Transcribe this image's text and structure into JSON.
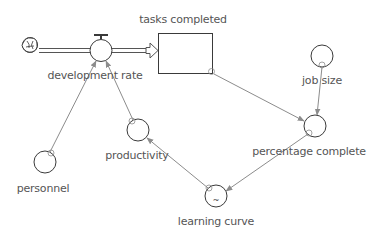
{
  "diagram": {
    "type": "stock-and-flow",
    "colors": {
      "shape_stroke": "#3a3a3a",
      "connector": "#8c8c8c",
      "label": "#555555",
      "background": "#ffffff"
    },
    "source": {
      "name": "cloud",
      "icon": "cloud-icon"
    },
    "flow": {
      "label": "development rate",
      "from": "cloud",
      "to": "tasks completed"
    },
    "stocks": [
      {
        "label": "tasks completed"
      }
    ],
    "converters": [
      {
        "id": "job_size",
        "label": "job size"
      },
      {
        "id": "percentage_complete",
        "label": "percentage complete"
      },
      {
        "id": "learning_curve",
        "label": "learning curve",
        "graphical_marker": "~"
      },
      {
        "id": "productivity",
        "label": "productivity"
      },
      {
        "id": "personnel",
        "label": "personnel"
      }
    ],
    "connectors": [
      {
        "from": "tasks completed",
        "to": "percentage complete"
      },
      {
        "from": "job size",
        "to": "percentage complete"
      },
      {
        "from": "percentage complete",
        "to": "learning curve"
      },
      {
        "from": "learning curve",
        "to": "productivity"
      },
      {
        "from": "productivity",
        "to": "development rate"
      },
      {
        "from": "personnel",
        "to": "development rate"
      }
    ]
  }
}
